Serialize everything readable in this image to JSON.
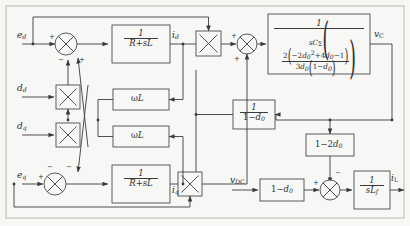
{
  "diagram": {
    "type": "control-block-diagram",
    "colors": {
      "background": "#f7f7f5",
      "line": "#3b3b3b",
      "block_stroke": "#4a4a4a",
      "text": "#2d2d2d"
    }
  },
  "inputs": [
    {
      "id": "e_d",
      "base": "e",
      "sub": "d",
      "label": "e_d"
    },
    {
      "id": "d_d",
      "base": "d",
      "sub": "d",
      "label": "d_d"
    },
    {
      "id": "d_q",
      "base": "d",
      "sub": "q",
      "label": "d_q"
    },
    {
      "id": "e_q",
      "base": "e",
      "sub": "q",
      "label": "e_q"
    },
    {
      "id": "v_DC",
      "base": "v",
      "sub": "DC",
      "label": "v_DC"
    }
  ],
  "signals": [
    {
      "id": "i_d",
      "base": "i",
      "sub": "d",
      "label": "i_d"
    },
    {
      "id": "i_q",
      "base": "i",
      "sub": "q",
      "label": "i_q"
    },
    {
      "id": "v_C",
      "base": "v",
      "sub": "C",
      "label": "v_C"
    },
    {
      "id": "i_L",
      "base": "i",
      "sub": "L",
      "label": "i_L"
    }
  ],
  "blocks": {
    "plant_d": {
      "name": "plant-d-block",
      "numerator": "1",
      "denominator": "R+sL",
      "den_parts": {
        "a": "R",
        "op": "+",
        "b": "sL"
      }
    },
    "plant_q": {
      "name": "plant-q-block",
      "numerator": "1",
      "denominator": "R+sL",
      "den_parts": {
        "a": "R",
        "op": "+",
        "b": "sL"
      }
    },
    "coupling_top": {
      "name": "coupling-gain-top",
      "label": "wL",
      "base": "ω",
      "italic": "L"
    },
    "coupling_bottom": {
      "name": "coupling-gain-bottom",
      "label": "wL",
      "base": "ω",
      "italic": "L"
    },
    "dc_link": {
      "name": "dc-link-transfer-block",
      "numerator": "1",
      "denominator_prefix": "sC",
      "denominator_prefix_sub": "Σ",
      "inner_numerator": "2(-2d0^2 + 4d0 - 1)",
      "inner_denominator": "3d0(1 - d0)",
      "inner_num_tokens": {
        "lead": "2",
        "openparen": "(",
        "t1": "−2",
        "t1_var": "d",
        "t1_sub": "0",
        "t1_pow": "2",
        "op1": "+",
        "t2": "4",
        "t2_var": "d",
        "t2_sub": "0",
        "op2": "−",
        "t3": "1",
        "closeparen": ")"
      },
      "inner_den_tokens": {
        "lead": "3",
        "var": "d",
        "sub": "0",
        "openparen": "(",
        "one": "1",
        "minus": "−",
        "var2": "d",
        "sub2": "0",
        "closeparen": ")"
      }
    },
    "feedback_gain": {
      "name": "feedback-gain-block",
      "numerator": "1",
      "denominator": "1-d0",
      "den_tokens": {
        "one": "1",
        "minus": "−",
        "var": "d",
        "sub": "0"
      }
    },
    "duty_gain": {
      "name": "duty-gain-block",
      "label": "1-2d0",
      "tokens": {
        "one": "1",
        "minus": "−",
        "two": "2",
        "var": "d",
        "sub": "0"
      }
    },
    "dc_gain": {
      "name": "dc-source-gain-block",
      "label": "1-d0",
      "tokens": {
        "one": "1",
        "minus": "−",
        "var": "d",
        "sub": "0"
      }
    },
    "filter_inductor": {
      "name": "filter-inductor-block",
      "numerator": "1",
      "denominator": "sLf",
      "den_tokens": {
        "s": "s",
        "L": "L",
        "sub": "f"
      }
    }
  },
  "multipliers": [
    {
      "id": "mul-d",
      "name": "multiplier-d",
      "glyph": "×"
    },
    {
      "id": "mul-dd",
      "name": "multiplier-dd",
      "glyph": "×"
    },
    {
      "id": "mul-dq",
      "name": "multiplier-dq",
      "glyph": "×"
    },
    {
      "id": "mul-q",
      "name": "multiplier-q",
      "glyph": "×"
    }
  ],
  "summing_junctions": [
    {
      "id": "sum-d",
      "name": "summing-junction-d",
      "signs": [
        {
          "port": "left",
          "sign": "+"
        },
        {
          "port": "bottom-left",
          "sign": "−"
        },
        {
          "port": "bottom-right",
          "sign": "+"
        }
      ]
    },
    {
      "id": "sum-dc",
      "name": "summing-junction-dc",
      "signs": [
        {
          "port": "left",
          "sign": "+"
        },
        {
          "port": "bottom",
          "sign": "+"
        }
      ]
    },
    {
      "id": "sum-q",
      "name": "summing-junction-q",
      "signs": [
        {
          "port": "left",
          "sign": "+"
        },
        {
          "port": "top-left",
          "sign": "−"
        },
        {
          "port": "top-right",
          "sign": "−"
        }
      ]
    },
    {
      "id": "sum-load",
      "name": "summing-junction-load",
      "signs": [
        {
          "port": "left",
          "sign": "+"
        },
        {
          "port": "top",
          "sign": "−"
        }
      ]
    }
  ]
}
